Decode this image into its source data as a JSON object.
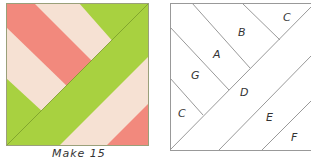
{
  "diagram": {
    "colors": {
      "green": "#a8d140",
      "pink": "#f2897d",
      "cream": "#f6e1d3",
      "line": "#8c8c8c"
    },
    "caption": "Make 15",
    "right_block_labels": [
      {
        "id": "C_top",
        "text": "C"
      },
      {
        "id": "B",
        "text": "B"
      },
      {
        "id": "A",
        "text": "A"
      },
      {
        "id": "G",
        "text": "G"
      },
      {
        "id": "D",
        "text": "D"
      },
      {
        "id": "C_bottom",
        "text": "C"
      },
      {
        "id": "E",
        "text": "E"
      },
      {
        "id": "F",
        "text": "F"
      }
    ]
  }
}
